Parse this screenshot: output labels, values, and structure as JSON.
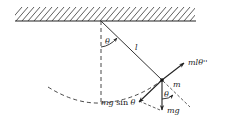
{
  "diagram": {
    "labels": {
      "theta_top": "θ",
      "length": "l",
      "tangential_inertia": "mlθ''",
      "mass": "m",
      "theta_bob": "θ",
      "tangential_gravity_prefix": "mg ",
      "tangential_gravity_sin": "sin ",
      "tangential_gravity_theta": "θ",
      "weight": "mg"
    },
    "colors": {
      "ink": "#222222",
      "background": "#ffffff"
    }
  }
}
